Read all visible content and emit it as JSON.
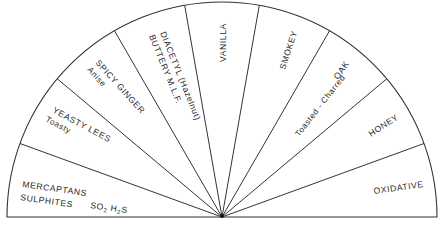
{
  "diagram": {
    "type": "semicircle-aroma-wheel",
    "center": [
      222,
      217
    ],
    "radius": 215,
    "line_color": "#333333",
    "segments": [
      {
        "id": "sulphides",
        "lines": [
          "MERCAPTANS",
          "SULPHITES"
        ],
        "extra": "SO2 H2S"
      },
      {
        "id": "yeasty-lees",
        "lines": [
          "YEASTY LEES",
          "Toasty"
        ]
      },
      {
        "id": "spicy-ginger",
        "lines": [
          "SPICY GINGER",
          "Anise"
        ]
      },
      {
        "id": "diacetyl",
        "lines": [
          "DIACETYL (Hazelnut)",
          "BUTTERY M.L.F."
        ]
      },
      {
        "id": "vanilla",
        "lines": [
          "VANILLA"
        ]
      },
      {
        "id": "smokey",
        "lines": [
          "SMOKEY"
        ]
      },
      {
        "id": "oak",
        "lines": [
          "OAK",
          "Toasted - Charred"
        ]
      },
      {
        "id": "honey",
        "lines": [
          "HONEY"
        ]
      },
      {
        "id": "oxidative",
        "lines": [
          "OXIDATIVE"
        ]
      }
    ]
  }
}
